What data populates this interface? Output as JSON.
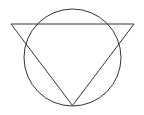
{
  "canvas": {
    "width": 144,
    "height": 115,
    "background_color": "#ffffff"
  },
  "figure": {
    "title": "Circle with inscribed inverted triangle",
    "stroke_color": "#333333",
    "stroke_width": 1,
    "fill": "none"
  },
  "shapes": {
    "circle": {
      "name": "circle",
      "center_x": 72.5,
      "center_y": 57.5,
      "radius": 48.5,
      "left_x": 24,
      "right_x": 121,
      "top_y": 9,
      "bottom_y": 106
    },
    "triangle": {
      "name": "inverted-triangle",
      "orientation": "point-down",
      "points": "11,24 134,24 72.5,105.5",
      "vertex_left_x": 11,
      "vertex_left_y": 24,
      "vertex_right_x": 134,
      "vertex_right_y": 24,
      "vertex_apex_x": 72.5,
      "vertex_apex_y": 105.5,
      "top_edge_y": 24,
      "base_width": 123,
      "height": 81.5
    }
  }
}
